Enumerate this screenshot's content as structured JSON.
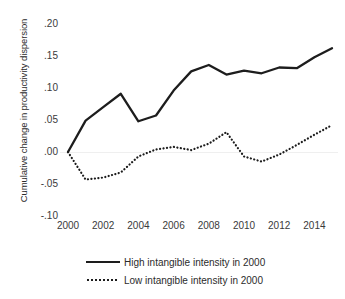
{
  "chart_data": {
    "type": "line",
    "title": "",
    "xlabel": "",
    "ylabel": "Cumulative change in productivity dispersion",
    "x": [
      2000,
      2001,
      2002,
      2003,
      2004,
      2005,
      2006,
      2007,
      2008,
      2009,
      2010,
      2011,
      2012,
      2013,
      2014,
      2015
    ],
    "xlim": [
      2000,
      2015
    ],
    "ylim": [
      -0.1,
      0.2
    ],
    "xticks": [
      2000,
      2002,
      2004,
      2006,
      2008,
      2010,
      2012,
      2014
    ],
    "xtick_labels": [
      "2000",
      "2002",
      "2004",
      "2006",
      "2008",
      "2010",
      "2012",
      "2014"
    ],
    "yticks": [
      0.2,
      0.15,
      0.1,
      0.05,
      0.0,
      -0.05,
      -0.1
    ],
    "ytick_labels": [
      ".20",
      ".15",
      ".10",
      ".05",
      ".00",
      "-.05",
      "-.10"
    ],
    "grid": false,
    "legend_position": "bottom",
    "series": [
      {
        "name": "High intangible intensity in 2000",
        "style": "solid",
        "color": "#1d1d1d",
        "values": [
          0.0,
          0.049,
          0.07,
          0.091,
          0.048,
          0.057,
          0.096,
          0.126,
          0.136,
          0.121,
          0.127,
          0.123,
          0.132,
          0.131,
          0.148,
          0.162
        ]
      },
      {
        "name": "Low intangible intensity in 2000",
        "style": "dotted",
        "color": "#1d1d1d",
        "values": [
          0.0,
          -0.043,
          -0.04,
          -0.032,
          -0.007,
          0.004,
          0.008,
          0.003,
          0.013,
          0.031,
          -0.007,
          -0.015,
          -0.004,
          0.011,
          0.027,
          0.042
        ]
      }
    ]
  },
  "legend": {
    "entries": [
      {
        "label": "High intangible intensity in 2000",
        "style": "solid"
      },
      {
        "label": "Low intangible intensity in 2000",
        "style": "dotted"
      }
    ]
  }
}
